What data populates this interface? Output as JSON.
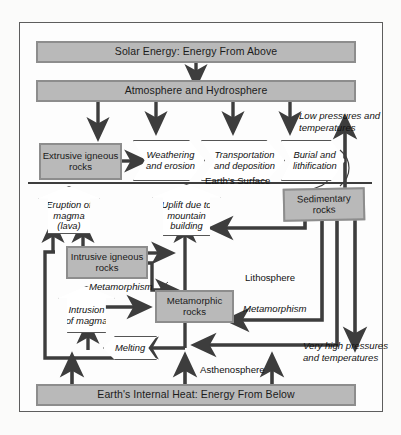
{
  "figure": {
    "frame_color": "#5d5d5d",
    "box_fill": "#b9b9b9",
    "box_border": "#8d8d8d",
    "arrow_color": "#3d3d3d"
  },
  "banners": {
    "top": "Solar Energy: Energy From Above",
    "second": "Atmosphere and Hydrosphere",
    "bottom": "Earth's Internal Heat: Energy From Below"
  },
  "rock_boxes": [
    {
      "id": "extrusive",
      "label": "Extrusive igneous rocks"
    },
    {
      "id": "sedimentary",
      "label": "Sedimentary rocks"
    },
    {
      "id": "intrusive",
      "label": "Intrusive igneous rocks"
    },
    {
      "id": "metamorphic",
      "label": "Metamorphic rocks"
    }
  ],
  "processes": [
    {
      "id": "weathering",
      "label": "Weathering and erosion",
      "shape": "arrow-right"
    },
    {
      "id": "transportation",
      "label": "Transportation and deposition",
      "shape": "arrow-right"
    },
    {
      "id": "burial",
      "label": "Burial and lithification",
      "shape": "arrow-right"
    },
    {
      "id": "eruption",
      "label": "Eruption of magma (lava)",
      "shape": "arrow-up"
    },
    {
      "id": "uplift",
      "label": "Uplift due to mountain building",
      "shape": "arrow-up"
    },
    {
      "id": "intrusion",
      "label": "Intrusion of magma",
      "shape": "arrow-up"
    },
    {
      "id": "melting",
      "label": "Melting",
      "shape": "arrow-left"
    }
  ],
  "labels": {
    "low_pressures": "Low pressures and temperatures",
    "earths_surface": "Earth's  Surface",
    "lithosphere": "Lithosphere",
    "asthenosphere": "Asthenosphere",
    "very_high": "Very high pressures and temperatures",
    "metamorphism_left": "Metamorphism",
    "metamorphism_right": "Metamorphism"
  }
}
